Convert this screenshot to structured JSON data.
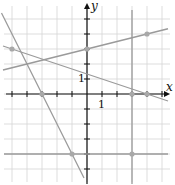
{
  "chart_data": {
    "type": "line",
    "title": "",
    "xlabel": "x",
    "ylabel": "y",
    "xlim": [
      -5.6,
      5.6
    ],
    "ylim": [
      -5.6,
      6.0
    ],
    "grid": true,
    "tick_labels": {
      "x": "1",
      "y": "1"
    },
    "origin_px": [
      87,
      94
    ],
    "unit_px": 15,
    "lines": [
      {
        "name": "line-a",
        "type": "sloped",
        "slope": 0.25,
        "intercept": 3,
        "points": [
          [
            0,
            3
          ],
          [
            4,
            4
          ]
        ]
      },
      {
        "name": "line-b",
        "type": "sloped",
        "slope": -0.3333,
        "intercept": 1.3333,
        "points": [
          [
            -5,
            3
          ],
          [
            4,
            0
          ]
        ]
      },
      {
        "name": "line-c",
        "type": "sloped",
        "slope": -2,
        "intercept": -6,
        "points": [
          [
            -3,
            0
          ],
          [
            -1,
            -4
          ]
        ]
      },
      {
        "name": "line-d",
        "type": "vertical",
        "x": 3,
        "points": [
          [
            3,
            0
          ],
          [
            3,
            -4
          ]
        ]
      },
      {
        "name": "line-e",
        "type": "horizontal",
        "y": -4,
        "points": [
          [
            -1,
            -4
          ],
          [
            3,
            -4
          ]
        ]
      }
    ],
    "marked_points": [
      [
        -5,
        3
      ],
      [
        0,
        3
      ],
      [
        4,
        4
      ],
      [
        -3,
        0
      ],
      [
        3,
        0
      ],
      [
        4,
        0
      ],
      [
        -1,
        -4
      ],
      [
        3,
        -4
      ]
    ]
  },
  "labels": {
    "x_axis": "x",
    "y_axis": "y",
    "x_tick": "1",
    "y_tick": "1"
  },
  "colors": {
    "line": "#9a9a9a",
    "point": "#a8a8a8",
    "grid": "#d4d4d4",
    "axis": "#111111"
  }
}
